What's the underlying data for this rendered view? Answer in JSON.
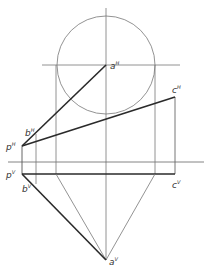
{
  "diagram": {
    "type": "descriptive-geometry-orthographic-projection",
    "colors": {
      "background": "#ffffff",
      "thin_line": "#666666",
      "thick_line": "#2a2a2a"
    },
    "labels": {
      "aH": {
        "base": "a",
        "sup": "H"
      },
      "bH": {
        "base": "b",
        "sup": "H"
      },
      "cH": {
        "base": "c",
        "sup": "H"
      },
      "pH": {
        "base": "p",
        "sup": "H"
      },
      "pV": {
        "base": "p",
        "sup": "V"
      },
      "bV": {
        "base": "b",
        "sup": "V"
      },
      "cV": {
        "base": "c",
        "sup": "V"
      },
      "aV": {
        "base": "a",
        "sup": "V"
      }
    },
    "points": {
      "aH": [
        106,
        65
      ],
      "bH": [
        36,
        134
      ],
      "cH": [
        175,
        97
      ],
      "pH": [
        22,
        146
      ],
      "pV": [
        22,
        174
      ],
      "bV": [
        36,
        184
      ],
      "cV": [
        175,
        174
      ],
      "aV": [
        106,
        260
      ]
    },
    "circle": {
      "cx": 106,
      "cy": 65,
      "r": 49
    },
    "ground_line_y": 162
  }
}
